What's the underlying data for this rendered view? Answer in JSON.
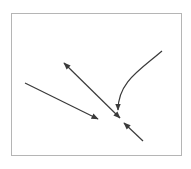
{
  "diagram": {
    "frame": {
      "x": 11.5,
      "y": 13.5,
      "width": 170,
      "height": 142,
      "stroke": "#b5b5b5"
    },
    "arrow_color": "#3a3a3a",
    "arrows": [
      {
        "name": "arrow-left-diagonal",
        "type": "single",
        "path": "M25,83 L98,119"
      },
      {
        "name": "arrow-double-headed",
        "type": "double",
        "path": "M64,63 L120,118"
      },
      {
        "name": "arrow-curved",
        "type": "single",
        "path": "M162,51 C140,70 118,82 118,110"
      },
      {
        "name": "arrow-bottom-right",
        "type": "single",
        "path": "M143,141 L124,123"
      }
    ]
  }
}
